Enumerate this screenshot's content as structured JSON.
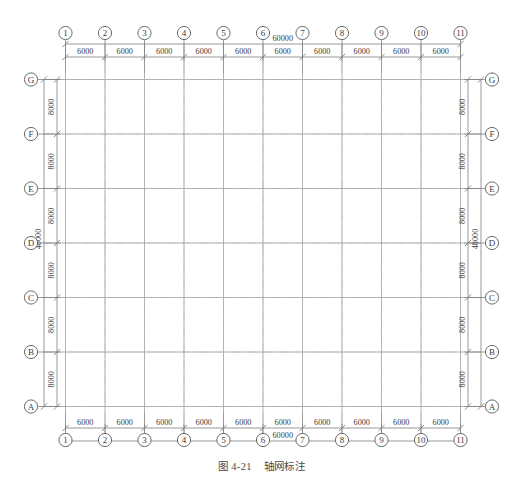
{
  "figure": {
    "caption_number": "图 4-21",
    "caption_title": "轴网标注"
  },
  "colors": {
    "grid_line": "#8c8c8c",
    "axis_line": "#6f6f6f",
    "dim_line": "#7d7d7d",
    "bubble_stroke": "#5a5a5a",
    "text": "#3c3c3c",
    "background": "#ffffff"
  },
  "chart_data": {
    "type": "diagram",
    "title": "轴网标注",
    "drawing_kind": "structural-grid-plan",
    "units": "mm",
    "horizontal_axes": {
      "labels": [
        "1",
        "2",
        "3",
        "4",
        "5",
        "6",
        "7",
        "8",
        "9",
        "10",
        "11"
      ],
      "spacings": [
        6000,
        6000,
        6000,
        6000,
        6000,
        6000,
        6000,
        6000,
        6000,
        6000
      ],
      "overall": 60000,
      "overall_label": "60000",
      "spacing_label": "6000",
      "count": 11,
      "x_positions": [
        65.5,
        105,
        144.5,
        184,
        223.5,
        263,
        302.5,
        342,
        381.5,
        421,
        460.5
      ]
    },
    "vertical_axes": {
      "labels_top_to_bottom": [
        "G",
        "F",
        "E",
        "D",
        "C",
        "B",
        "A"
      ],
      "spacings": [
        8000,
        8000,
        8000,
        8000,
        8000,
        8000
      ],
      "overall": 48000,
      "overall_label": "48000",
      "spacing_label": "8000",
      "count": 7,
      "y_positions": [
        79.5,
        134,
        188.5,
        243,
        297.5,
        352,
        406.5
      ]
    },
    "dimension_strings": {
      "top_chain_values": [
        "6000",
        "6000",
        "6000",
        "6000",
        "6000",
        "6000",
        "6000",
        "6000",
        "6000",
        "6000"
      ],
      "top_overall_value": "60000",
      "bottom_chain_values": [
        "6000",
        "6000",
        "6000",
        "6000",
        "6000",
        "6000",
        "6000",
        "6000",
        "6000",
        "6000"
      ],
      "bottom_overall_value": "60000",
      "left_chain_values": [
        "8000",
        "8000",
        "8000",
        "8000",
        "8000",
        "8000"
      ],
      "left_overall_value": "48000",
      "right_chain_values": [
        "8000",
        "8000",
        "8000",
        "8000",
        "8000",
        "8000"
      ],
      "right_overall_value": "48000"
    }
  }
}
